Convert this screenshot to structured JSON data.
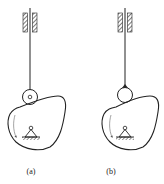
{
  "figure": {
    "panels": [
      {
        "id": "a",
        "caption": "(a)",
        "follower_type": "roller follower",
        "rotation": "counterclockwise arrow on cam"
      },
      {
        "id": "b",
        "caption": "(b)",
        "follower_type": "round-tip follower",
        "rotation": "counterclockwise arrow on cam"
      }
    ]
  },
  "colors": {
    "line": "#222222",
    "background": "#ffffff"
  }
}
